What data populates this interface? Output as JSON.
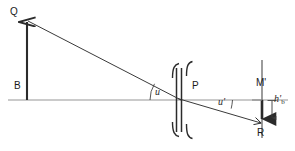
{
  "diagram": {
    "type": "optical-ray-diagram",
    "background_color": "#ffffff",
    "stroke_color": "#2b2b2b",
    "axis_color": "#b5b5b5",
    "labels": {
      "object_top": "Q",
      "object_base": "B",
      "lens_center": "P",
      "image_axis_point": "M'",
      "image_bottom": "R",
      "angle_object": "u",
      "angle_image": "u'",
      "image_height": "h'",
      "image_height_subscript": "b"
    },
    "geometry": {
      "axis_y": 100,
      "axis_x_start": 8,
      "axis_x_end": 288,
      "object_x": 27,
      "object_top_y": 20,
      "lens_x": 180,
      "lens_top_y": 62,
      "lens_bottom_y": 140,
      "image_plane_x": 262,
      "image_plane_top_y": 60,
      "image_plane_bottom_y": 138,
      "image_bottom_y": 124,
      "hb_arrow_x": 272,
      "ray_start": [
        27,
        20
      ],
      "ray_lens": [
        180,
        100
      ],
      "ray_end": [
        262,
        124
      ]
    }
  }
}
